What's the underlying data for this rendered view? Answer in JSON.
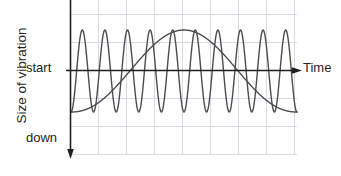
{
  "chart_data": {
    "type": "line",
    "title": "",
    "xlabel": "Time",
    "ylabel": "Size of vibration",
    "grid": true,
    "legend_position": "none",
    "axis_origin_label": "start",
    "axis_negative_label": "down",
    "annotations": [
      {
        "text": "start",
        "role": "y-axis-zero-tick"
      },
      {
        "text": "down",
        "role": "y-axis-negative-direction"
      },
      {
        "text": "Time",
        "role": "x-axis-arrow-label"
      }
    ],
    "xlim": [
      0,
      10
    ],
    "ylim": [
      -1.6,
      1.25
    ],
    "series": [
      {
        "name": "vibration-waveform",
        "type": "oscillation",
        "cycles": 10,
        "amplitude": 1.0,
        "baseline": 0.0,
        "peak_value": 1.0,
        "trough_value": -1.0,
        "color": "#4d4d4d"
      },
      {
        "name": "amplitude-envelope",
        "type": "bell-curve",
        "start_value": -1.0,
        "peak_value": 1.0,
        "end_value": -1.0,
        "peak_position_x": 5.0,
        "color": "#4d4d4d"
      }
    ],
    "colors": {
      "grid": "#d6dce4",
      "axis": "#231f20",
      "curve": "#4d4d4d",
      "text": "#231f20",
      "background": "#ffffff"
    }
  }
}
